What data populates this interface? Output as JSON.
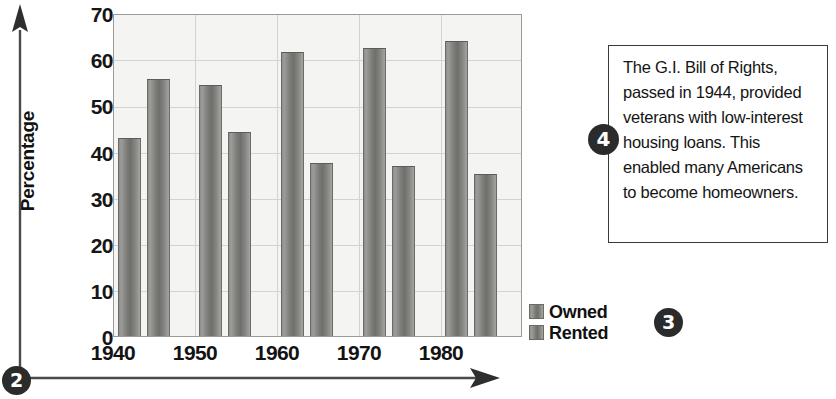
{
  "chart_data": {
    "type": "bar",
    "title": "",
    "xlabel": "",
    "ylabel": "Percentage",
    "categories": [
      "1940",
      "1950",
      "1960",
      "1970",
      "1980"
    ],
    "series": [
      {
        "name": "Owned",
        "values": [
          43.0,
          54.3,
          61.5,
          62.5,
          64.0
        ]
      },
      {
        "name": "Rented",
        "values": [
          55.8,
          44.3,
          37.5,
          36.8,
          35.2
        ]
      }
    ],
    "ylim": [
      0,
      70
    ],
    "yticks": [
      0,
      10,
      20,
      30,
      40,
      50,
      60,
      70
    ],
    "ytick_labels": [
      "0",
      "10",
      "20",
      "30",
      "40",
      "50",
      "60",
      "70"
    ],
    "grid": true,
    "legend_position": "bottom-right",
    "bar_color": "#7b7b78",
    "plot_background": "#f4f4f2",
    "gridline_color": "#d2d4cf"
  },
  "axis": {
    "y_title": "Percentage",
    "y_arrow_name": "y-axis-arrow",
    "x_arrow_name": "x-axis-arrow"
  },
  "legend": {
    "items": [
      {
        "label": "Owned"
      },
      {
        "label": "Rented"
      }
    ]
  },
  "callout": {
    "text": "The G.I. Bill of Rights, passed in 1944, provided veterans with low-interest housing loans. This enabled many Americans to become homeowners.",
    "border_color": "#3a3a3a"
  },
  "markers": [
    {
      "id": "marker-2",
      "label": "2"
    },
    {
      "id": "marker-3",
      "label": "3"
    },
    {
      "id": "marker-4",
      "label": "4"
    }
  ]
}
